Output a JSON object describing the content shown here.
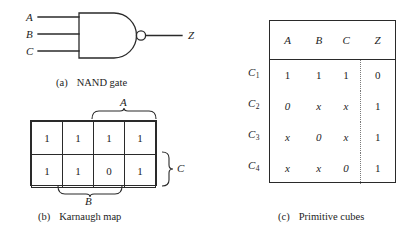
{
  "figure": {
    "parts": [
      {
        "tag": "(a)",
        "label": "NAND gate"
      },
      {
        "tag": "(b)",
        "label": "Karnaugh map"
      },
      {
        "tag": "(c)",
        "label": "Primitive cubes"
      }
    ]
  },
  "nand_gate": {
    "inputs": [
      "A",
      "B",
      "C"
    ],
    "output": "Z",
    "bubble": "inversion-bubble",
    "caption_tag": "(a)",
    "caption_label": "NAND gate"
  },
  "karnaugh_map": {
    "caption_tag": "(b)",
    "caption_label": "Karnaugh map",
    "rows": [
      [
        "1",
        "1",
        "1",
        "1"
      ],
      [
        "1",
        "1",
        "0",
        "1"
      ]
    ],
    "brace_top_label": "A",
    "brace_bottom_label": "B",
    "brace_right_label": "C"
  },
  "primitive_cubes": {
    "caption_tag": "(c)",
    "caption_label": "Primitive cubes",
    "headers": [
      "A",
      "B",
      "C",
      "Z"
    ],
    "row_labels": [
      "C",
      "C",
      "C",
      "C"
    ],
    "row_subscripts": [
      "1",
      "2",
      "3",
      "4"
    ],
    "rows": [
      [
        "1",
        "1",
        "1",
        "0"
      ],
      [
        "0",
        "x",
        "x",
        "1"
      ],
      [
        "x",
        "0",
        "x",
        "1"
      ],
      [
        "x",
        "x",
        "0",
        "1"
      ]
    ]
  },
  "colors": {
    "ink": "#1d1d1d",
    "line": "#2a2a2a",
    "dotted": "#7a7a7a",
    "background": "#ffffff"
  }
}
